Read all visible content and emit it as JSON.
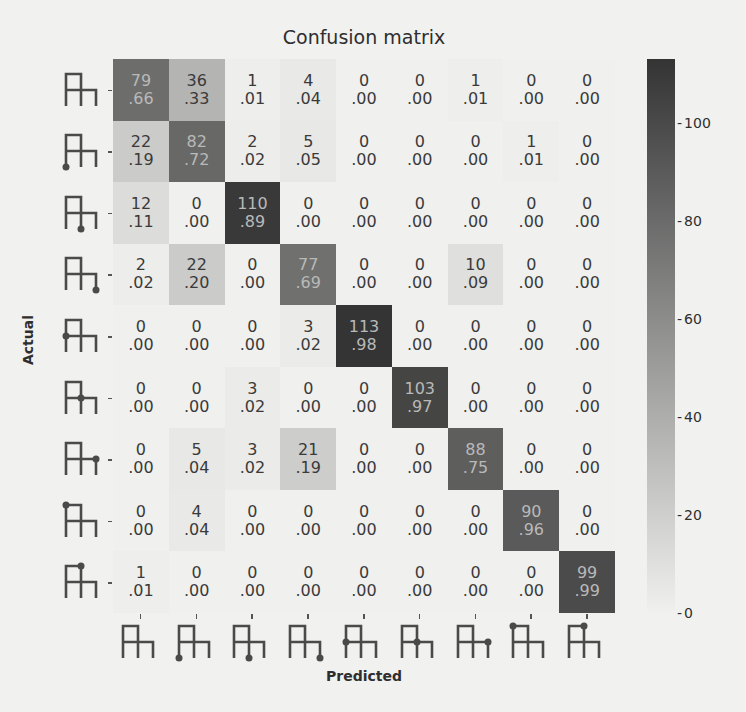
{
  "chart_data": {
    "type": "heatmap",
    "title": "Confusion matrix",
    "xlabel": "Predicted",
    "ylabel": "Actual",
    "row_labels": [
      "glyph-0",
      "glyph-1",
      "glyph-2",
      "glyph-3",
      "glyph-4",
      "glyph-5",
      "glyph-6",
      "glyph-7",
      "glyph-8"
    ],
    "col_labels": [
      "glyph-0",
      "glyph-1",
      "glyph-2",
      "glyph-3",
      "glyph-4",
      "glyph-5",
      "glyph-6",
      "glyph-7",
      "glyph-8"
    ],
    "glyph_dot_positions": [
      "none",
      "bottom-left",
      "bottom-middle",
      "bottom-right",
      "mid-left",
      "mid-center",
      "mid-right",
      "top-left",
      "top-middle"
    ],
    "counts": [
      [
        79,
        36,
        1,
        4,
        0,
        0,
        1,
        0,
        0
      ],
      [
        22,
        82,
        2,
        5,
        0,
        0,
        0,
        1,
        0
      ],
      [
        12,
        0,
        110,
        0,
        0,
        0,
        0,
        0,
        0
      ],
      [
        2,
        22,
        0,
        77,
        0,
        0,
        10,
        0,
        0
      ],
      [
        0,
        0,
        0,
        3,
        113,
        0,
        0,
        0,
        0
      ],
      [
        0,
        0,
        3,
        0,
        0,
        103,
        0,
        0,
        0
      ],
      [
        0,
        5,
        3,
        21,
        0,
        0,
        88,
        0,
        0
      ],
      [
        0,
        4,
        0,
        0,
        0,
        0,
        0,
        90,
        0
      ],
      [
        1,
        0,
        0,
        0,
        0,
        0,
        0,
        0,
        99
      ]
    ],
    "normalized": [
      [
        ".66",
        ".33",
        ".01",
        ".04",
        ".00",
        ".00",
        ".01",
        ".00",
        ".00"
      ],
      [
        ".19",
        ".72",
        ".02",
        ".05",
        ".00",
        ".00",
        ".00",
        ".01",
        ".00"
      ],
      [
        ".11",
        ".00",
        ".89",
        ".00",
        ".00",
        ".00",
        ".00",
        ".00",
        ".00"
      ],
      [
        ".02",
        ".20",
        ".00",
        ".69",
        ".00",
        ".00",
        ".09",
        ".00",
        ".00"
      ],
      [
        ".00",
        ".00",
        ".00",
        ".02",
        ".98",
        ".00",
        ".00",
        ".00",
        ".00"
      ],
      [
        ".00",
        ".00",
        ".02",
        ".00",
        ".00",
        ".97",
        ".00",
        ".00",
        ".00"
      ],
      [
        ".00",
        ".04",
        ".02",
        ".19",
        ".00",
        ".00",
        ".75",
        ".00",
        ".00"
      ],
      [
        ".00",
        ".04",
        ".00",
        ".00",
        ".00",
        ".00",
        ".00",
        ".96",
        ".00"
      ],
      [
        ".01",
        ".00",
        ".00",
        ".00",
        ".00",
        ".00",
        ".00",
        ".00",
        ".99"
      ]
    ],
    "colorbar": {
      "ticks": [
        "100",
        "80",
        "60",
        "40",
        "20",
        "0"
      ],
      "range": [
        0,
        113
      ]
    },
    "colormap": "greys"
  }
}
